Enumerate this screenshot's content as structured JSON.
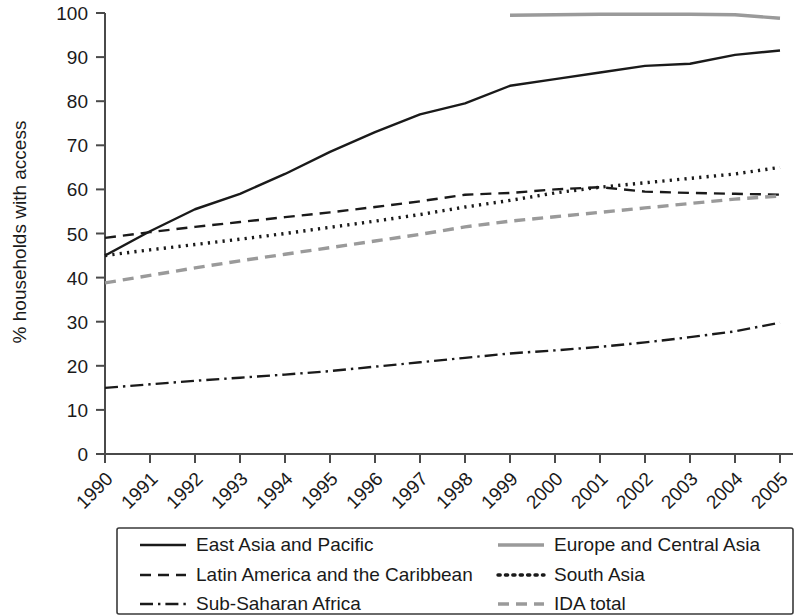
{
  "chart_data": {
    "type": "line",
    "title": "",
    "xlabel": "",
    "ylabel": "% households with access",
    "ylim": [
      0,
      100
    ],
    "yticks": [
      0,
      10,
      20,
      30,
      40,
      50,
      60,
      70,
      80,
      90,
      100
    ],
    "grid": false,
    "legend_position": "bottom",
    "x": [
      1990,
      1991,
      1992,
      1993,
      1994,
      1995,
      1996,
      1997,
      1998,
      1999,
      2000,
      2001,
      2002,
      2003,
      2004,
      2005
    ],
    "categories": [
      "1990",
      "1991",
      "1992",
      "1993",
      "1994",
      "1995",
      "1996",
      "1997",
      "1998",
      "1999",
      "2000",
      "2001",
      "2002",
      "2003",
      "2004",
      "2005"
    ],
    "series": [
      {
        "name": "East Asia and Pacific",
        "style": "solid",
        "color": "#1a1a1a",
        "values": [
          45.0,
          50.5,
          55.5,
          59.0,
          63.5,
          68.5,
          73.0,
          77.0,
          79.5,
          83.5,
          85.0,
          86.5,
          88.0,
          88.5,
          90.5,
          91.5
        ]
      },
      {
        "name": "Europe and Central Asia",
        "style": "solid",
        "color": "#9a9a9a",
        "values": [
          null,
          null,
          null,
          null,
          null,
          null,
          null,
          null,
          null,
          99.5,
          99.6,
          99.7,
          99.7,
          99.7,
          99.6,
          98.8
        ]
      },
      {
        "name": "Latin America and the Caribbean",
        "style": "dashed",
        "color": "#1a1a1a",
        "values": [
          49.0,
          50.3,
          51.5,
          52.6,
          53.7,
          54.8,
          56.0,
          57.3,
          58.8,
          59.2,
          60.0,
          60.5,
          59.5,
          59.2,
          59.0,
          58.8
        ]
      },
      {
        "name": "South Asia",
        "style": "dotted",
        "color": "#1a1a1a",
        "values": [
          45.0,
          46.3,
          47.5,
          48.7,
          50.0,
          51.4,
          52.8,
          54.3,
          56.0,
          57.5,
          59.2,
          60.5,
          61.5,
          62.5,
          63.5,
          65.0
        ]
      },
      {
        "name": "Sub-Saharan Africa",
        "style": "dashdot",
        "color": "#1a1a1a",
        "values": [
          15.0,
          15.8,
          16.6,
          17.3,
          18.0,
          18.8,
          19.8,
          20.8,
          21.8,
          22.8,
          23.5,
          24.3,
          25.3,
          26.5,
          27.8,
          29.8
        ]
      },
      {
        "name": "IDA total",
        "style": "dashed",
        "color": "#9a9a9a",
        "values": [
          38.8,
          40.5,
          42.2,
          43.8,
          45.3,
          46.8,
          48.3,
          49.8,
          51.5,
          52.8,
          53.8,
          54.8,
          55.8,
          56.8,
          57.8,
          58.5
        ]
      }
    ]
  },
  "legend": {
    "entries": [
      {
        "label": "East Asia and Pacific",
        "style": "solid",
        "color": "#1a1a1a"
      },
      {
        "label": "Europe and Central Asia",
        "style": "solid",
        "color": "#9a9a9a"
      },
      {
        "label": "Latin America and the Caribbean",
        "style": "dashed",
        "color": "#1a1a1a"
      },
      {
        "label": "South Asia",
        "style": "dotted",
        "color": "#1a1a1a"
      },
      {
        "label": "Sub-Saharan Africa",
        "style": "dashdot",
        "color": "#1a1a1a"
      },
      {
        "label": "IDA total",
        "style": "dashed",
        "color": "#9a9a9a"
      }
    ]
  }
}
